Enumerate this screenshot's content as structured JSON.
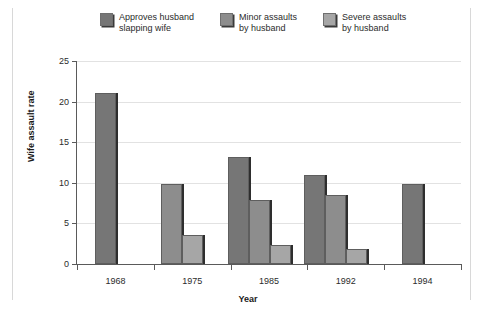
{
  "chart_data": {
    "type": "bar",
    "title": "",
    "xlabel": "Year",
    "ylabel": "Wife assault rate",
    "categories": [
      "1968",
      "1975",
      "1985",
      "1992",
      "1994"
    ],
    "ylim": [
      0,
      25
    ],
    "yticks": [
      0,
      5,
      10,
      15,
      20,
      25
    ],
    "ytick_labels": [
      "0",
      "5",
      "10",
      "15",
      "20",
      "25"
    ],
    "grid": true,
    "legend_position": "top",
    "series": [
      {
        "name": "Approves husband slapping wife",
        "color": "#767676",
        "values": [
          21.1,
          null,
          13.2,
          11.0,
          9.9
        ]
      },
      {
        "name": "Minor assaults by husband",
        "color": "#8d8d8d",
        "values": [
          null,
          9.8,
          7.9,
          8.5,
          null
        ]
      },
      {
        "name": "Severe assaults by husband",
        "color": "#a6a6a6",
        "values": [
          null,
          3.6,
          2.4,
          1.9,
          null
        ]
      }
    ]
  },
  "legend": {
    "items": [
      {
        "label": "Approves husband\nslapping wife",
        "color": "#767676"
      },
      {
        "label": "Minor assaults\nby husband",
        "color": "#8d8d8d"
      },
      {
        "label": "Severe assaults\nby husband",
        "color": "#a6a6a6"
      }
    ]
  }
}
